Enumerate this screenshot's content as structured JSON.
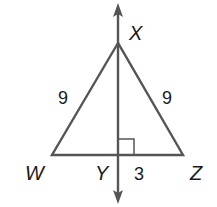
{
  "diagram": {
    "type": "isosceles-triangle-with-perpendicular-bisector",
    "vertices": {
      "X": {
        "label": "X",
        "x": 118,
        "y": 43
      },
      "W": {
        "label": "W",
        "x": 52,
        "y": 155
      },
      "Z": {
        "label": "Z",
        "x": 183,
        "y": 155
      },
      "Y": {
        "label": "Y",
        "x": 118,
        "y": 155
      }
    },
    "side_lengths": {
      "WX": "9",
      "XZ": "9",
      "YZ": "3"
    },
    "right_angle_at": "Y",
    "line_color": "#555555",
    "label_color": "#1a1a1a"
  }
}
